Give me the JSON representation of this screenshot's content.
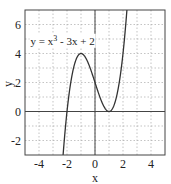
{
  "chart_data": {
    "type": "line",
    "title": "",
    "xlabel": "x",
    "ylabel": "y",
    "xlim": [
      -5,
      5
    ],
    "ylim": [
      -3,
      7
    ],
    "xticks": [
      -4,
      -2,
      0,
      2,
      4
    ],
    "yticks": [
      -2,
      0,
      2,
      4,
      6
    ],
    "xtick_labels": [
      "-4",
      "-2",
      "0",
      "2",
      "4"
    ],
    "ytick_labels": [
      "-2",
      "0",
      "2",
      "4",
      "6"
    ],
    "grid": true,
    "grid_style": "dotted",
    "minor_grid_step": 1,
    "axes_lines": {
      "x_axis_at": 0,
      "y_axis_at": 0
    },
    "series": [
      {
        "name": "y = x^3 - 3x + 2",
        "function": "x^3 - 3x + 2",
        "color": "#333333",
        "x": [
          -2.3,
          -2.2,
          -2.1,
          -2.0,
          -1.8,
          -1.6,
          -1.4,
          -1.2,
          -1.0,
          -0.8,
          -0.6,
          -0.4,
          -0.2,
          0.0,
          0.2,
          0.4,
          0.6,
          0.8,
          1.0,
          1.2,
          1.4,
          1.6,
          1.8,
          2.0,
          2.2,
          2.3
        ],
        "y": [
          -3.267,
          -2.048,
          -0.961,
          0.0,
          1.568,
          2.704,
          3.456,
          3.872,
          4.0,
          3.888,
          3.584,
          3.136,
          2.592,
          2.0,
          1.408,
          0.864,
          0.416,
          0.112,
          0.0,
          0.128,
          0.544,
          1.296,
          2.432,
          4.0,
          6.048,
          7.267
        ]
      }
    ],
    "annotations": [
      {
        "text_parts": [
          "y = x",
          "3",
          " - 3x + 2"
        ],
        "x": -4.6,
        "y": 4.6,
        "boxed": true
      }
    ]
  }
}
